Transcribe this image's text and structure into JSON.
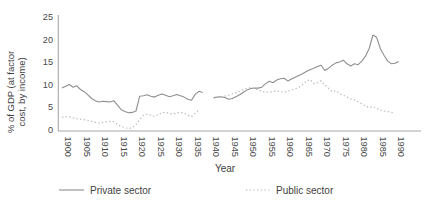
{
  "chart_data": {
    "type": "line",
    "title": "",
    "xlabel": "Year",
    "ylabel": "% of GDP (at factor cost, by income)",
    "ylabel_lines": [
      "% of GDP (at factor",
      "cost, by income)"
    ],
    "x_ticks": [
      1900,
      1905,
      1910,
      1915,
      1920,
      1925,
      1930,
      1935,
      1940,
      1945,
      1950,
      1955,
      1960,
      1965,
      1970,
      1975,
      1980,
      1985,
      1990
    ],
    "y_ticks": [
      0,
      5,
      10,
      15,
      20,
      25
    ],
    "xlim": [
      1899,
      1997
    ],
    "ylim": [
      0,
      25
    ],
    "grid": false,
    "legend_position": "bottom",
    "axis_color": "#a8a8a8",
    "text_color": "#4a4a4a",
    "series": [
      {
        "name": "Private sector",
        "style": "solid",
        "color": "#8f8f8f",
        "segments": [
          {
            "points": [
              [
                1900,
                9.2
              ],
              [
                1901,
                9.6
              ],
              [
                1902,
                10.0
              ],
              [
                1903,
                9.4
              ],
              [
                1904,
                9.7
              ],
              [
                1905,
                8.9
              ],
              [
                1906,
                8.4
              ],
              [
                1907,
                7.7
              ],
              [
                1908,
                6.9
              ],
              [
                1909,
                6.4
              ],
              [
                1910,
                6.1
              ],
              [
                1911,
                6.3
              ],
              [
                1912,
                6.2
              ],
              [
                1913,
                6.1
              ],
              [
                1914,
                6.4
              ],
              [
                1915,
                5.4
              ],
              [
                1916,
                4.4
              ],
              [
                1917,
                4.0
              ],
              [
                1918,
                3.7
              ],
              [
                1919,
                3.8
              ],
              [
                1920,
                4.1
              ],
              [
                1921,
                7.4
              ],
              [
                1922,
                7.5
              ],
              [
                1923,
                7.7
              ],
              [
                1924,
                7.4
              ],
              [
                1925,
                7.2
              ],
              [
                1926,
                7.6
              ],
              [
                1927,
                7.9
              ],
              [
                1928,
                7.6
              ],
              [
                1929,
                7.3
              ],
              [
                1930,
                7.5
              ],
              [
                1931,
                7.8
              ],
              [
                1932,
                7.5
              ],
              [
                1933,
                7.2
              ],
              [
                1934,
                6.7
              ],
              [
                1935,
                6.5
              ],
              [
                1936,
                7.8
              ],
              [
                1937,
                8.5
              ],
              [
                1938,
                8.2
              ]
            ]
          },
          {
            "points": [
              [
                1941,
                7.1
              ],
              [
                1942,
                7.2
              ],
              [
                1943,
                7.3
              ],
              [
                1944,
                7.1
              ],
              [
                1945,
                6.7
              ],
              [
                1946,
                6.9
              ],
              [
                1947,
                7.3
              ],
              [
                1948,
                7.7
              ],
              [
                1949,
                8.3
              ],
              [
                1950,
                8.8
              ],
              [
                1951,
                9.1
              ],
              [
                1952,
                9.2
              ],
              [
                1953,
                9.2
              ],
              [
                1954,
                9.4
              ],
              [
                1955,
                10.2
              ],
              [
                1956,
                10.7
              ],
              [
                1957,
                10.4
              ],
              [
                1958,
                11.0
              ],
              [
                1959,
                11.3
              ],
              [
                1960,
                11.4
              ],
              [
                1961,
                10.8
              ],
              [
                1962,
                11.2
              ],
              [
                1963,
                11.6
              ],
              [
                1964,
                12.0
              ],
              [
                1965,
                12.4
              ],
              [
                1966,
                12.9
              ],
              [
                1967,
                13.3
              ],
              [
                1968,
                13.6
              ],
              [
                1969,
                14.0
              ],
              [
                1970,
                14.3
              ],
              [
                1971,
                13.1
              ],
              [
                1972,
                13.6
              ],
              [
                1973,
                14.3
              ],
              [
                1974,
                14.8
              ],
              [
                1975,
                15.0
              ],
              [
                1976,
                15.4
              ],
              [
                1977,
                14.6
              ],
              [
                1978,
                14.1
              ],
              [
                1979,
                14.6
              ],
              [
                1980,
                14.4
              ],
              [
                1981,
                15.2
              ],
              [
                1982,
                16.3
              ],
              [
                1983,
                18.0
              ],
              [
                1984,
                21.0
              ],
              [
                1985,
                20.5
              ],
              [
                1986,
                18.0
              ],
              [
                1987,
                16.5
              ],
              [
                1988,
                15.2
              ],
              [
                1989,
                14.6
              ],
              [
                1990,
                14.7
              ],
              [
                1991,
                15.1
              ]
            ]
          }
        ]
      },
      {
        "name": "Public sector",
        "style": "dotted",
        "color": "#b6b6b6",
        "segments": [
          {
            "points": [
              [
                1900,
                2.7
              ],
              [
                1901,
                2.9
              ],
              [
                1902,
                2.8
              ],
              [
                1903,
                2.6
              ],
              [
                1904,
                2.4
              ],
              [
                1905,
                2.3
              ],
              [
                1906,
                2.2
              ],
              [
                1907,
                2.0
              ],
              [
                1908,
                1.8
              ],
              [
                1909,
                1.6
              ],
              [
                1910,
                1.4
              ],
              [
                1911,
                1.6
              ],
              [
                1912,
                1.7
              ],
              [
                1913,
                1.8
              ],
              [
                1914,
                1.7
              ],
              [
                1915,
                1.1
              ],
              [
                1916,
                0.7
              ],
              [
                1917,
                0.4
              ],
              [
                1918,
                0.2
              ],
              [
                1919,
                0.4
              ],
              [
                1920,
                1.1
              ],
              [
                1921,
                2.2
              ],
              [
                1922,
                3.2
              ],
              [
                1923,
                3.4
              ],
              [
                1924,
                3.2
              ],
              [
                1925,
                2.9
              ],
              [
                1926,
                3.3
              ],
              [
                1927,
                3.7
              ],
              [
                1928,
                3.8
              ],
              [
                1929,
                3.6
              ],
              [
                1930,
                3.4
              ],
              [
                1931,
                3.7
              ],
              [
                1932,
                3.8
              ],
              [
                1933,
                3.6
              ],
              [
                1934,
                3.2
              ],
              [
                1935,
                2.9
              ],
              [
                1936,
                3.6
              ],
              [
                1937,
                4.4
              ]
            ]
          },
          {
            "points": [
              [
                1941,
                6.9
              ],
              [
                1942,
                7.1
              ],
              [
                1943,
                7.3
              ],
              [
                1944,
                7.4
              ],
              [
                1945,
                7.6
              ],
              [
                1946,
                7.9
              ],
              [
                1947,
                8.2
              ],
              [
                1948,
                8.5
              ],
              [
                1949,
                8.9
              ],
              [
                1950,
                9.2
              ],
              [
                1951,
                9.3
              ],
              [
                1952,
                9.1
              ],
              [
                1953,
                8.8
              ],
              [
                1954,
                8.5
              ],
              [
                1955,
                8.3
              ],
              [
                1956,
                8.3
              ],
              [
                1957,
                8.4
              ],
              [
                1958,
                8.6
              ],
              [
                1959,
                8.4
              ],
              [
                1960,
                8.3
              ],
              [
                1961,
                8.5
              ],
              [
                1962,
                8.8
              ],
              [
                1963,
                9.0
              ],
              [
                1964,
                9.4
              ],
              [
                1965,
                10.0
              ],
              [
                1966,
                10.7
              ],
              [
                1967,
                11.1
              ],
              [
                1968,
                10.2
              ],
              [
                1969,
                10.4
              ],
              [
                1970,
                10.8
              ],
              [
                1971,
                9.9
              ],
              [
                1972,
                9.2
              ],
              [
                1973,
                8.4
              ],
              [
                1974,
                8.6
              ],
              [
                1975,
                8.0
              ],
              [
                1976,
                7.6
              ],
              [
                1977,
                7.2
              ],
              [
                1978,
                6.8
              ],
              [
                1979,
                6.6
              ],
              [
                1980,
                6.2
              ],
              [
                1981,
                5.7
              ],
              [
                1982,
                5.2
              ],
              [
                1983,
                4.9
              ],
              [
                1984,
                5.1
              ],
              [
                1985,
                4.7
              ],
              [
                1986,
                4.3
              ],
              [
                1987,
                4.1
              ],
              [
                1988,
                4.0
              ],
              [
                1989,
                3.8
              ],
              [
                1990,
                3.6
              ]
            ]
          }
        ]
      }
    ]
  }
}
